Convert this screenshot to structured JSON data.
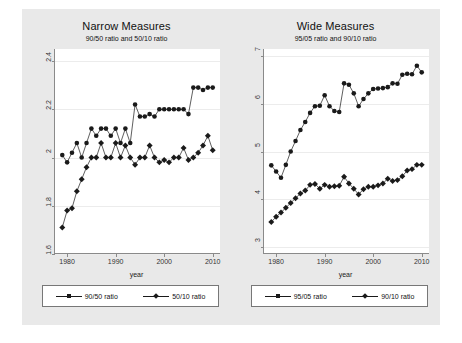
{
  "figure": {
    "background_color": "#e9e9e9",
    "plot_background_color": "#ffffff",
    "series_color": "#1a1a1a",
    "grid_color": "#ececec"
  },
  "panels": [
    {
      "key": "narrow",
      "title": "Narrow Measures",
      "subtitle": "90/50 ratio and 50/10 ratio",
      "xlabel": "year",
      "legend": [
        {
          "label": "90/50 ratio",
          "marker": "circle"
        },
        {
          "label": "50/10 ratio",
          "marker": "diamond"
        }
      ]
    },
    {
      "key": "wide",
      "title": "Wide Measures",
      "subtitle": "95/05 ratio and 90/10 ratio",
      "xlabel": "year",
      "legend": [
        {
          "label": "95/05 ratio",
          "marker": "circle"
        },
        {
          "label": "90/10 ratio",
          "marker": "diamond"
        }
      ]
    }
  ],
  "chart_data": [
    {
      "type": "line",
      "title": "Narrow Measures",
      "subtitle": "90/50 ratio and 50/10 ratio",
      "xlabel": "year",
      "ylabel": "",
      "xlim": [
        1977.5,
        2011.5
      ],
      "ylim": [
        1.6,
        2.45
      ],
      "xticks": [
        1980,
        1990,
        2000,
        2010
      ],
      "yticks": [
        1.6,
        1.8,
        2,
        2.2,
        2.4
      ],
      "ytick_labels": [
        "1.6",
        "1.8",
        "2",
        "2.2",
        "2.4"
      ],
      "grid": "horizontal",
      "legend_position": "below",
      "x": [
        1979,
        1980,
        1981,
        1982,
        1983,
        1984,
        1985,
        1986,
        1987,
        1988,
        1989,
        1990,
        1991,
        1992,
        1993,
        1994,
        1995,
        1996,
        1997,
        1998,
        1999,
        2000,
        2001,
        2002,
        2003,
        2004,
        2005,
        2006,
        2007,
        2008,
        2009,
        2010
      ],
      "series": [
        {
          "name": "90/50 ratio",
          "marker": "circle",
          "values": [
            2.01,
            1.98,
            2.02,
            2.06,
            2.0,
            2.06,
            2.12,
            2.09,
            2.12,
            2.12,
            2.09,
            2.12,
            2.06,
            2.12,
            2.06,
            2.22,
            2.17,
            2.17,
            2.18,
            2.17,
            2.2,
            2.2,
            2.2,
            2.2,
            2.2,
            2.2,
            2.18,
            2.29,
            2.29,
            2.28,
            2.29,
            2.29
          ]
        },
        {
          "name": "50/10 ratio",
          "marker": "diamond",
          "values": [
            1.71,
            1.78,
            1.79,
            1.86,
            1.91,
            1.96,
            2.0,
            2.0,
            2.06,
            2.0,
            2.0,
            2.06,
            2.0,
            2.05,
            2.0,
            1.97,
            2.0,
            2.0,
            2.05,
            2.0,
            1.98,
            1.99,
            1.98,
            2.0,
            2.0,
            2.04,
            1.99,
            2.0,
            2.02,
            2.05,
            2.09,
            2.03
          ]
        }
      ]
    },
    {
      "type": "line",
      "title": "Wide Measures",
      "subtitle": "95/05 ratio and 90/10 ratio",
      "xlabel": "year",
      "ylabel": "",
      "xlim": [
        1977.5,
        2011.5
      ],
      "ylim": [
        2.85,
        7.15
      ],
      "xticks": [
        1980,
        1990,
        2000,
        2010
      ],
      "yticks": [
        3,
        4,
        5,
        6,
        7
      ],
      "ytick_labels": [
        "3",
        "4",
        "5",
        "6",
        "7"
      ],
      "grid": "horizontal",
      "legend_position": "below",
      "x": [
        1979,
        1980,
        1981,
        1982,
        1983,
        1984,
        1985,
        1986,
        1987,
        1988,
        1989,
        1990,
        1991,
        1992,
        1993,
        1994,
        1995,
        1996,
        1997,
        1998,
        1999,
        2000,
        2001,
        2002,
        2003,
        2004,
        2005,
        2006,
        2007,
        2008,
        2009,
        2010
      ],
      "series": [
        {
          "name": "95/05 ratio",
          "marker": "circle",
          "values": [
            4.71,
            4.58,
            4.45,
            4.72,
            5.0,
            5.22,
            5.45,
            5.62,
            5.81,
            5.95,
            5.96,
            6.18,
            5.95,
            5.85,
            5.83,
            6.43,
            6.4,
            6.22,
            5.95,
            6.1,
            6.22,
            6.31,
            6.32,
            6.33,
            6.35,
            6.43,
            6.42,
            6.61,
            6.63,
            6.62,
            6.8,
            6.66,
            6.63
          ]
        },
        {
          "name": "90/10 ratio",
          "marker": "diamond",
          "values": [
            3.52,
            3.63,
            3.72,
            3.82,
            3.92,
            4.02,
            4.12,
            4.18,
            4.3,
            4.32,
            4.22,
            4.3,
            4.26,
            4.27,
            4.28,
            4.47,
            4.33,
            4.22,
            4.1,
            4.21,
            4.26,
            4.26,
            4.29,
            4.33,
            4.43,
            4.38,
            4.4,
            4.48,
            4.6,
            4.63,
            4.72,
            4.72
          ]
        }
      ]
    }
  ]
}
